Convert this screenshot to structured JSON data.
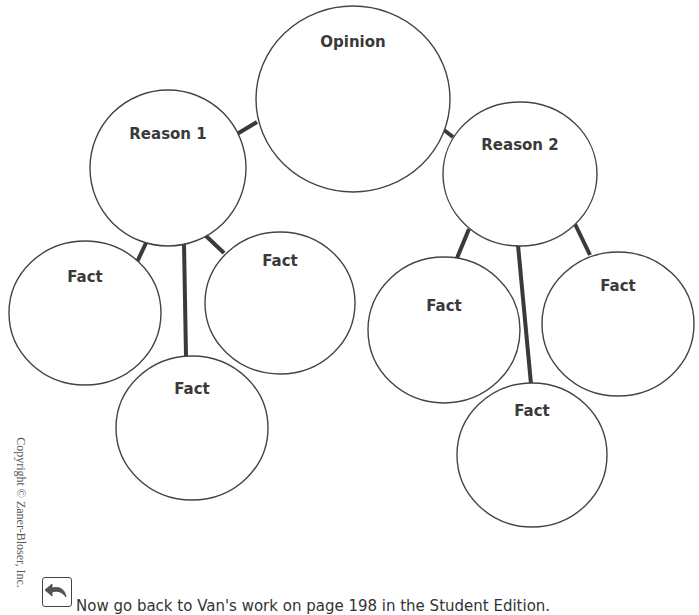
{
  "diagram": {
    "type": "opinion-reason-fact web",
    "stroke_color": "#444444",
    "nodes": [
      {
        "id": "opinion",
        "label": "Opinion",
        "cx": 353,
        "cy": 99,
        "rx": 97,
        "ry": 93,
        "label_y": 47
      },
      {
        "id": "reason1",
        "label": "Reason 1",
        "cx": 168,
        "cy": 168,
        "rx": 78,
        "ry": 78,
        "label_y": 139
      },
      {
        "id": "reason2",
        "label": "Reason 2",
        "cx": 520,
        "cy": 174,
        "rx": 77,
        "ry": 72,
        "label_y": 150
      },
      {
        "id": "r1-fact-left",
        "label": "Fact",
        "cx": 85,
        "cy": 313,
        "rx": 76,
        "ry": 72,
        "label_y": 282
      },
      {
        "id": "r1-fact-right",
        "label": "Fact",
        "cx": 280,
        "cy": 303,
        "rx": 75,
        "ry": 71,
        "label_y": 266
      },
      {
        "id": "r1-fact-bottom",
        "label": "Fact",
        "cx": 192,
        "cy": 428,
        "rx": 76,
        "ry": 72,
        "label_y": 394
      },
      {
        "id": "r2-fact-left",
        "label": "Fact",
        "cx": 444,
        "cy": 330,
        "rx": 76,
        "ry": 73,
        "label_y": 311
      },
      {
        "id": "r2-fact-right",
        "label": "Fact",
        "cx": 618,
        "cy": 324,
        "rx": 76,
        "ry": 72,
        "label_y": 291
      },
      {
        "id": "r2-fact-bottom",
        "label": "Fact",
        "cx": 532,
        "cy": 455,
        "rx": 75,
        "ry": 72,
        "label_y": 416
      }
    ],
    "edges": [
      {
        "from": "opinion",
        "to": "reason1",
        "x1": 257,
        "y1": 122,
        "x2": 237,
        "y2": 134
      },
      {
        "from": "opinion",
        "to": "reason2",
        "x1": 444,
        "y1": 130,
        "x2": 453,
        "y2": 137
      },
      {
        "from": "reason1",
        "to": "r1-fact-left",
        "x1": 147,
        "y1": 241,
        "x2": 137,
        "y2": 262
      },
      {
        "from": "reason1",
        "to": "r1-fact-bottom",
        "x1": 184,
        "y1": 243,
        "x2": 186,
        "y2": 356
      },
      {
        "from": "reason1",
        "to": "r1-fact-right",
        "x1": 205,
        "y1": 235,
        "x2": 224,
        "y2": 253
      },
      {
        "from": "reason2",
        "to": "r2-fact-left",
        "x1": 469,
        "y1": 229,
        "x2": 457,
        "y2": 258
      },
      {
        "from": "reason2",
        "to": "r2-fact-bottom",
        "x1": 518,
        "y1": 245,
        "x2": 531,
        "y2": 384
      },
      {
        "from": "reason2",
        "to": "r2-fact-right",
        "x1": 575,
        "y1": 224,
        "x2": 590,
        "y2": 255
      }
    ]
  },
  "labels": {
    "opinion": "Opinion",
    "reason1": "Reason 1",
    "reason2": "Reason 2",
    "fact": "Fact"
  },
  "sidebar": {
    "copyright": "Copyright © Zaner-Bloser, Inc."
  },
  "footer": {
    "icon": "return-arrow-icon",
    "instruction": "Now go back to Van's work on page 198 in the Student Edition."
  }
}
